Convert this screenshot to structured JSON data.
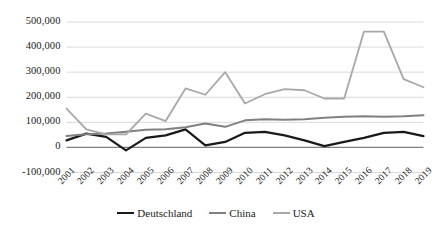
{
  "chart_data": {
    "type": "line",
    "title": "",
    "subtitle": "",
    "xlabel": "",
    "ylabel": "",
    "grid": true,
    "legend_position": "bottom",
    "xlim": [
      2001,
      2019
    ],
    "ylim": [
      -100000,
      500000
    ],
    "ytick_step": 100000,
    "categories": [
      "2001",
      "2002",
      "2003",
      "2004",
      "2005",
      "2006",
      "2007",
      "2008",
      "2009",
      "2010",
      "2011",
      "2012",
      "2013",
      "2014",
      "2015",
      "2016",
      "2017",
      "2018",
      "2019"
    ],
    "ytick_labels": [
      "500,000",
      "400,000",
      "300,000",
      "200,000",
      "100,000",
      "0",
      "-100,000"
    ],
    "ytick_values": [
      500000,
      400000,
      300000,
      200000,
      100000,
      0,
      -100000
    ],
    "series": [
      {
        "name": "Deutschland",
        "color": "#1a1a1a",
        "width": 2.2,
        "values": [
          28000,
          55000,
          42000,
          -12000,
          38000,
          48000,
          72000,
          8000,
          22000,
          58000,
          62000,
          48000,
          28000,
          5000,
          22000,
          38000,
          58000,
          62000,
          45000
        ]
      },
      {
        "name": "China",
        "color": "#808080",
        "width": 2.0,
        "values": [
          46000,
          52000,
          55000,
          62000,
          70000,
          72000,
          80000,
          95000,
          82000,
          108000,
          112000,
          110000,
          112000,
          118000,
          122000,
          124000,
          122000,
          124000,
          128000
        ]
      },
      {
        "name": "USA",
        "color": "#a8a8a8",
        "width": 1.8,
        "values": [
          155000,
          72000,
          52000,
          52000,
          135000,
          105000,
          235000,
          210000,
          300000,
          175000,
          212000,
          232000,
          228000,
          195000,
          195000,
          462000,
          462000,
          272000,
          240000
        ]
      }
    ]
  },
  "legend": {
    "items": [
      {
        "label": "Deutschland",
        "color": "#1a1a1a",
        "width": 2.6
      },
      {
        "label": "China",
        "color": "#808080",
        "width": 2.2
      },
      {
        "label": "USA",
        "color": "#a8a8a8",
        "width": 2.0
      }
    ]
  },
  "axes": {
    "zero_line_color": "#7f7f7f",
    "grid_color": "#d9d9d9"
  }
}
